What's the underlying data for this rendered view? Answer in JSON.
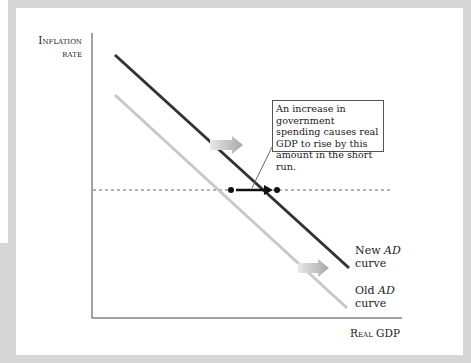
{
  "figure": {
    "y_axis_label_line1": "Inflation",
    "y_axis_label_line2": "rate",
    "x_axis_label": "Real GDP",
    "callout_text": "An increase in government spending causes real GDP to rise by this amount in the short run.",
    "new_curve": {
      "line1_prefix": "New ",
      "line1_italic": "AD",
      "line2": "curve",
      "color": "#333333"
    },
    "old_curve": {
      "line1_prefix": "Old ",
      "line1_italic": "AD",
      "line2": "curve",
      "color": "#c8c8c8"
    },
    "shift_arrow_color": "#b0b0b0",
    "frame_color": "#d6d6d6"
  }
}
